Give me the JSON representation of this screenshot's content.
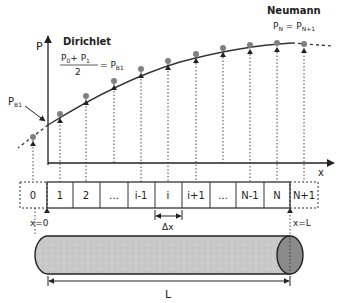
{
  "labels": {
    "p_axis": "P",
    "x_axis": "x",
    "dirichlet_title": "Dirichlet",
    "dirichlet_num": "P",
    "dirichlet_num_sub0": "0",
    "dirichlet_plus": "+ P",
    "dirichlet_num_sub1": "1",
    "dirichlet_den": "2",
    "dirichlet_eq": "= P",
    "dirichlet_eq_sub": "B1",
    "neumann_title": "Neumann",
    "neumann_lhs": "P",
    "neumann_lhs_sub": "N",
    "neumann_eq": " = P",
    "neumann_rhs_sub": "N+1",
    "pb1": "P",
    "pb1_sub": "B1",
    "x0": "x=0",
    "xL": "x=L",
    "dx": "Δx",
    "L": "L"
  },
  "cells": [
    "0",
    "1",
    "2",
    "…",
    "i-1",
    "i",
    "i+1",
    "…",
    "N-1",
    "N",
    "N+1"
  ],
  "colors": {
    "line": "#333333",
    "point": "#808080",
    "rod_fill": "#c8c8c8",
    "rod_end": "#8a8a8a"
  }
}
